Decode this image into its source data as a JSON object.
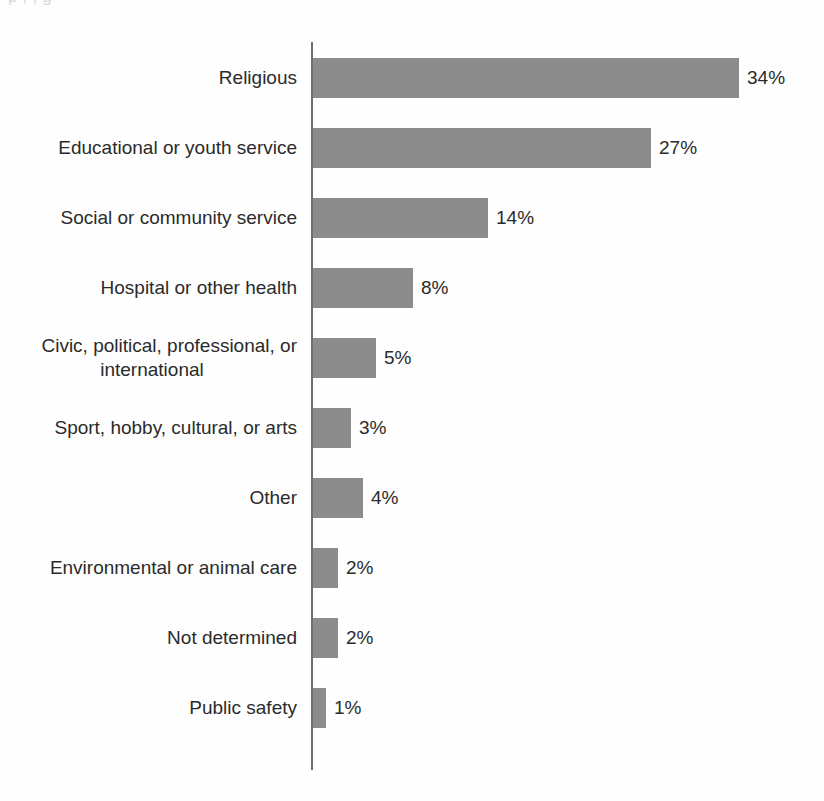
{
  "page": {
    "top_cut_text": "p                                       ,             ,                  g",
    "bottom_cut_text": ""
  },
  "chart_data": {
    "type": "bar",
    "orientation": "horizontal",
    "title": "",
    "xlabel": "",
    "ylabel": "",
    "grid": false,
    "legend": null,
    "axis_line": true,
    "value_label_suffix": "%",
    "xlim": [
      0,
      34
    ],
    "bar_color": "#8c8c8c",
    "text_color": "#2b2b2b",
    "categories": [
      "Religious",
      "Educational or youth service",
      "Social or community service",
      "Hospital or other health",
      "Civic, political, professional, or international",
      "Sport, hobby, cultural, or arts",
      "Other",
      "Environmental or animal care",
      "Not determined",
      "Public safety"
    ],
    "values": [
      34,
      27,
      14,
      8,
      5,
      3,
      4,
      2,
      2,
      1
    ],
    "value_labels": [
      "34%",
      "27%",
      "14%",
      "8%",
      "5%",
      "3%",
      "4%",
      "2%",
      "2%",
      "1%"
    ],
    "bars": [
      {
        "label": "Religious",
        "label_line1": "Religious",
        "label_line2": "",
        "value": 34,
        "value_label": "34%"
      },
      {
        "label": "Educational or youth service",
        "label_line1": "Educational or youth service",
        "label_line2": "",
        "value": 27,
        "value_label": "27%"
      },
      {
        "label": "Social or community service",
        "label_line1": "Social or community service",
        "label_line2": "",
        "value": 14,
        "value_label": "14%"
      },
      {
        "label": "Hospital or other health",
        "label_line1": "Hospital or other health",
        "label_line2": "",
        "value": 8,
        "value_label": "8%"
      },
      {
        "label": "Civic, political, professional, or international",
        "label_line1": "Civic, political, professional, or",
        "label_line2": "international",
        "value": 5,
        "value_label": "5%"
      },
      {
        "label": "Sport, hobby, cultural, or arts",
        "label_line1": "Sport, hobby, cultural, or arts",
        "label_line2": "",
        "value": 3,
        "value_label": "3%"
      },
      {
        "label": "Other",
        "label_line1": "Other",
        "label_line2": "",
        "value": 4,
        "value_label": "4%"
      },
      {
        "label": "Environmental or animal care",
        "label_line1": "Environmental or animal care",
        "label_line2": "",
        "value": 2,
        "value_label": "2%"
      },
      {
        "label": "Not determined",
        "label_line1": "Not determined",
        "label_line2": "",
        "value": 2,
        "value_label": "2%"
      },
      {
        "label": "Public safety",
        "label_line1": "Public safety",
        "label_line2": "",
        "value": 1,
        "value_label": "1%"
      }
    ]
  }
}
